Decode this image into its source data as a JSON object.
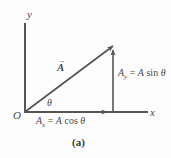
{
  "figure": {
    "caption": "(a)",
    "axes": {
      "y_label": "y",
      "x_label": "x",
      "origin_label": "O"
    },
    "vector": {
      "symbol": "A",
      "arrow_accent": "→",
      "angle_label": "θ"
    },
    "components": {
      "x": {
        "symbol": "A",
        "subscript": "x",
        "equals": "=",
        "magnitude": "A",
        "function": "cos",
        "angle": "θ",
        "full_text": "Ax = A cos θ"
      },
      "y": {
        "symbol": "A",
        "subscript": "y",
        "equals": "=",
        "magnitude": "A",
        "function": "sin",
        "angle": "θ",
        "full_text": "Ay = A sin θ"
      }
    },
    "colors": {
      "line": "#555555",
      "text": "#4a4a4a",
      "background": "#fdfdfd"
    }
  }
}
